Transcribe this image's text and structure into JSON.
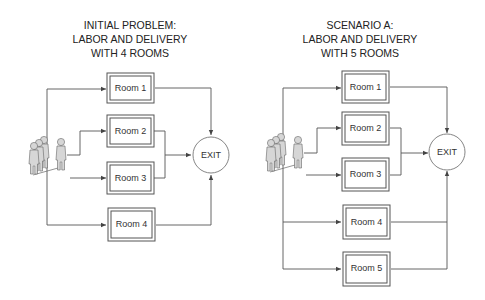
{
  "diagrams": [
    {
      "id": "initial",
      "title_lines": [
        "INITIAL PROBLEM:",
        "LABOR AND DELIVERY",
        "WITH 4 ROOMS"
      ],
      "rooms": [
        "Room 1",
        "Room 2",
        "Room 3",
        "Room 4"
      ],
      "exit_label": "EXIT"
    },
    {
      "id": "scenario-a",
      "title_lines": [
        "SCENARIO A:",
        "LABOR AND DELIVERY",
        "WITH 5 ROOMS"
      ],
      "rooms": [
        "Room 1",
        "Room 2",
        "Room 3",
        "Room 4",
        "Room 5"
      ],
      "exit_label": "EXIT"
    }
  ],
  "colors": {
    "line": "#555555",
    "box_border": "#555555",
    "person_fill": "#d6d6d6",
    "background": "#ffffff"
  }
}
